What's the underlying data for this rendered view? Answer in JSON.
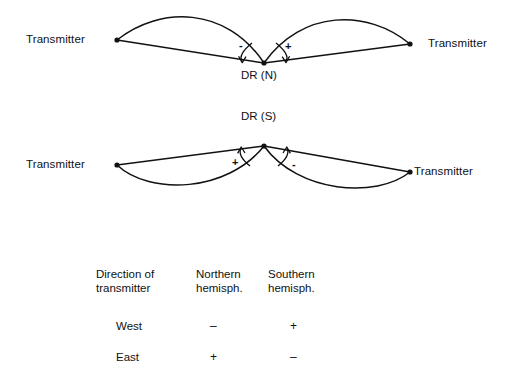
{
  "figure": {
    "upper_diagram": {
      "left_transmitter_label": "Transmitter",
      "right_transmitter_label": "Transmitter",
      "vertex_label": "DR (N)",
      "left_sign": "-",
      "right_sign": "+"
    },
    "lower_diagram": {
      "left_transmitter_label": "Transmitter",
      "right_transmitter_label": "Transmitter",
      "vertex_label": "DR (S)",
      "left_sign": "+",
      "right_sign": "-"
    },
    "table": {
      "headers": [
        "Direction of\ntransmitter",
        "Northern\nhemisph.",
        "Southern\nhemisph."
      ],
      "rows": [
        {
          "direction": "West",
          "northern": "–",
          "southern": "+"
        },
        {
          "direction": "East",
          "northern": "+",
          "southern": "–"
        }
      ]
    },
    "colors": {
      "background": "#ffffff",
      "stroke": "#111111",
      "text": "#111111"
    }
  }
}
